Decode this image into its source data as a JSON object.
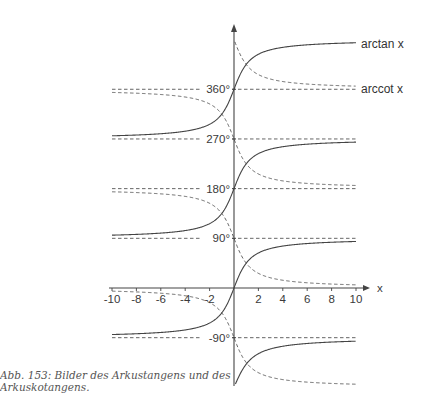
{
  "chart_data": {
    "type": "line",
    "title": "",
    "caption": "Abb. 153: Bilder des Arkustangens und des Arkuskotangens.",
    "xlabel": "x",
    "ylabel": "",
    "xlim": [
      -10,
      10
    ],
    "ylim_deg": [
      -180,
      450
    ],
    "x_ticks": [
      -10,
      -8,
      -6,
      -4,
      -2,
      2,
      4,
      6,
      8,
      10
    ],
    "y_ticks_deg": [
      -90,
      90,
      180,
      270,
      360
    ],
    "y_tick_labels": [
      "-90°",
      "90°",
      "180°",
      "270°",
      "360°"
    ],
    "grid": false,
    "asymptote_lines_deg": [
      -90,
      0,
      90,
      180,
      270,
      360
    ],
    "series": [
      {
        "name": "arctan x",
        "style": "solid",
        "branches_center_deg": [
          0,
          180,
          360
        ],
        "branch_range_deg": 90,
        "partial_branch": {
          "center_deg": -180,
          "x_range": [
            0,
            10
          ]
        }
      },
      {
        "name": "arccot x",
        "style": "dashed",
        "branches_offset_deg": [
          -180,
          0,
          180,
          360
        ],
        "formula": "arccot x = 90° - arctan x + k·180°"
      }
    ],
    "legend": [
      "arctan x",
      "arccot x"
    ],
    "legend_position": "right-inline"
  },
  "labels": {
    "x_axis": "x",
    "arctan": "arctan  x",
    "arccot": "arccot  x",
    "caption": "Abb. 153: Bilder des Arkustangens und des Arkuskotangens."
  }
}
